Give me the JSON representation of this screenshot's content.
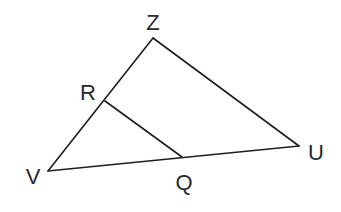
{
  "diagram": {
    "type": "triangle-with-segment",
    "points": {
      "Z": {
        "label": "Z",
        "x": 153,
        "y": 38,
        "label_x": 153,
        "label_y": 30
      },
      "U": {
        "label": "U",
        "x": 299,
        "y": 146,
        "label_x": 316,
        "label_y": 160
      },
      "V": {
        "label": "V",
        "x": 48,
        "y": 171,
        "label_x": 33,
        "label_y": 184
      },
      "R": {
        "label": "R",
        "x": 105,
        "y": 101,
        "label_x": 88,
        "label_y": 100
      },
      "Q": {
        "label": "Q",
        "x": 182,
        "y": 157,
        "label_x": 184,
        "label_y": 190
      }
    },
    "segments": [
      {
        "from": "V",
        "to": "Z"
      },
      {
        "from": "Z",
        "to": "U"
      },
      {
        "from": "U",
        "to": "V"
      },
      {
        "from": "R",
        "to": "Q"
      }
    ]
  }
}
